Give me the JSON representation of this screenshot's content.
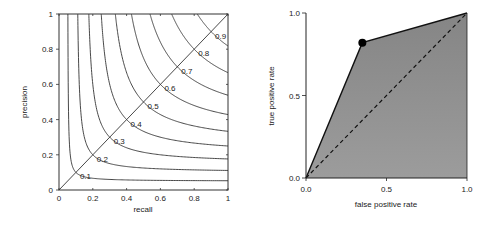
{
  "chart_data": [
    {
      "type": "line",
      "title": "",
      "xlabel": "recall",
      "ylabel": "precision",
      "xlim": [
        0,
        1
      ],
      "ylim": [
        0,
        1
      ],
      "xticks": [
        "0",
        "0.2",
        "0.4",
        "0.6",
        "0.8",
        "1"
      ],
      "yticks": [
        "0",
        "0.2",
        "0.4",
        "0.6",
        "0.8",
        "1"
      ],
      "grid": false,
      "description": "Iso-F1 contour lines (F = 2PR/(P+R)) with diagonal P=R",
      "contour_levels": [
        0.1,
        0.2,
        0.3,
        0.4,
        0.5,
        0.6,
        0.7,
        0.8,
        0.9
      ],
      "contour_labels": [
        "0.1",
        "0.2",
        "0.3",
        "0.4",
        "0.5",
        "0.6",
        "0.7",
        "0.8",
        "0.9"
      ],
      "diagonal": {
        "x": [
          0,
          1
        ],
        "y": [
          0,
          1
        ]
      }
    },
    {
      "type": "area",
      "title": "",
      "xlabel": "false positive rate",
      "ylabel": "true positive rate",
      "xlim": [
        0,
        1
      ],
      "ylim": [
        0,
        1
      ],
      "xticks": [
        "0.0",
        "0.5",
        "1.0"
      ],
      "yticks": [
        "0.0",
        "0.5",
        "1.0"
      ],
      "grid": false,
      "series": [
        {
          "name": "ROC curve",
          "x": [
            0.0,
            0.35,
            1.0
          ],
          "y": [
            0.0,
            0.82,
            1.0
          ],
          "style": "solid",
          "filled": true
        },
        {
          "name": "random classifier",
          "x": [
            0.0,
            1.0
          ],
          "y": [
            0.0,
            1.0
          ],
          "style": "dashed"
        }
      ],
      "marker_point": {
        "x": 0.35,
        "y": 0.82
      },
      "fill_color": "#8c8c8c"
    }
  ],
  "left_plot": {
    "xlabel": "recall",
    "ylabel": "precision",
    "xticks": [
      "0",
      "0.2",
      "0.4",
      "0.6",
      "0.8",
      "1"
    ],
    "yticks": [
      "0",
      "0.2",
      "0.4",
      "0.6",
      "0.8",
      "1"
    ],
    "contour_labels": [
      "0.1",
      "0.2",
      "0.3",
      "0.4",
      "0.5",
      "0.6",
      "0.7",
      "0.8",
      "0.9"
    ]
  },
  "right_plot": {
    "xlabel": "false positive rate",
    "ylabel": "true positive rate",
    "xticks": [
      "0.0",
      "0.5",
      "1.0"
    ],
    "yticks": [
      "0.0",
      "0.5",
      "1.0"
    ]
  }
}
